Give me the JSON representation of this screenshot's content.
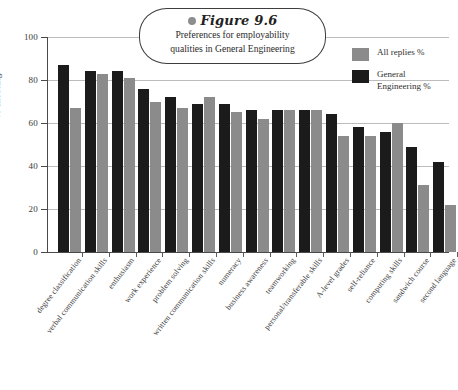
{
  "figure": {
    "label": "Figure 9.6",
    "dot_icon": "bullet-dot-icon",
    "title_line1": "Preferences for employability",
    "title_line2": "qualities in General Engineering"
  },
  "legend": {
    "position": "top-right",
    "entries": [
      {
        "label": "All replies %",
        "color": "#8b8b8b"
      },
      {
        "label": "General\nEngineering %",
        "color": "#1b1b1b"
      }
    ]
  },
  "axes": {
    "ylabel": "% choosing",
    "yticks": [
      "0",
      "20",
      "40",
      "60",
      "80",
      "100"
    ],
    "ymin": 0,
    "ymax": 100
  },
  "chart_data": {
    "type": "bar",
    "title": "Preferences for employability qualities in General Engineering",
    "xlabel": "",
    "ylabel": "% choosing",
    "ylim": [
      0,
      100
    ],
    "yticks": [
      0,
      20,
      40,
      60,
      80,
      100
    ],
    "grid": true,
    "legend_position": "top-right",
    "categories": [
      "degree classification",
      "verbal communication skills",
      "enthusiasm",
      "work experience",
      "problem solving",
      "written communication skills",
      "numeracy",
      "business awareness",
      "teamworking",
      "personal/transferable skills",
      "A-level grades",
      "self-reliance",
      "computing skills",
      "sandwich course",
      "second language"
    ],
    "series": [
      {
        "name": "General Engineering %",
        "color": "#1b1b1b",
        "values": [
          87,
          84,
          84,
          76,
          72,
          69,
          69,
          66,
          66,
          66,
          64,
          58,
          56,
          49,
          42
        ]
      },
      {
        "name": "All replies %",
        "color": "#8b8b8b",
        "values": [
          67,
          83,
          81,
          70,
          67,
          72,
          65,
          62,
          66,
          66,
          54,
          54,
          60,
          31,
          22
        ]
      }
    ]
  }
}
